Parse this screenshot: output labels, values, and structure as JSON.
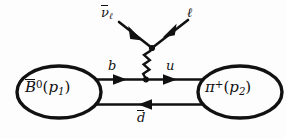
{
  "figure": {
    "kind": "feynman-diagram",
    "process": "B̄⁰(p₁) → π⁺(p₂) ℓ ν̄ℓ",
    "background_color": "#fdfdfd",
    "line_color": "#111111"
  },
  "blobs": {
    "left": {
      "name": "initial-meson",
      "symbol": "B",
      "bar": true,
      "superscript": "0",
      "momentum_open": "(",
      "momentum_symbol": "p",
      "momentum_index": "1",
      "momentum_close": ")",
      "plain_text": "B̄0(p1)"
    },
    "right": {
      "name": "final-meson",
      "symbol": "π",
      "bar": false,
      "superscript": "+",
      "momentum_open": "(",
      "momentum_symbol": "p",
      "momentum_index": "2",
      "momentum_close": ")",
      "plain_text": "π+(p2)"
    }
  },
  "quark_lines": {
    "top": {
      "name": "b-to-u-line",
      "left_label": "b",
      "right_label": "u",
      "direction": "rightward",
      "arrow_count": 2
    },
    "bottom": {
      "name": "dbar-spectator-line",
      "label_symbol": "d",
      "label_bar": true,
      "label_plain": "d̄",
      "direction": "leftward",
      "arrow_count": 1
    }
  },
  "boson": {
    "name": "w-boson-propagator",
    "style": "wavy",
    "label": ""
  },
  "leptons": {
    "antineutrino": {
      "name": "antineutrino-leg",
      "symbol": "ν",
      "bar": true,
      "subscript": "ℓ",
      "plain_text": "ν̄ℓ",
      "arrow_direction": "into-vertex"
    },
    "charged_lepton": {
      "name": "charged-lepton-leg",
      "symbol": "ℓ",
      "bar": false,
      "subscript": "",
      "plain_text": "ℓ",
      "arrow_direction": "out-of-vertex"
    }
  }
}
